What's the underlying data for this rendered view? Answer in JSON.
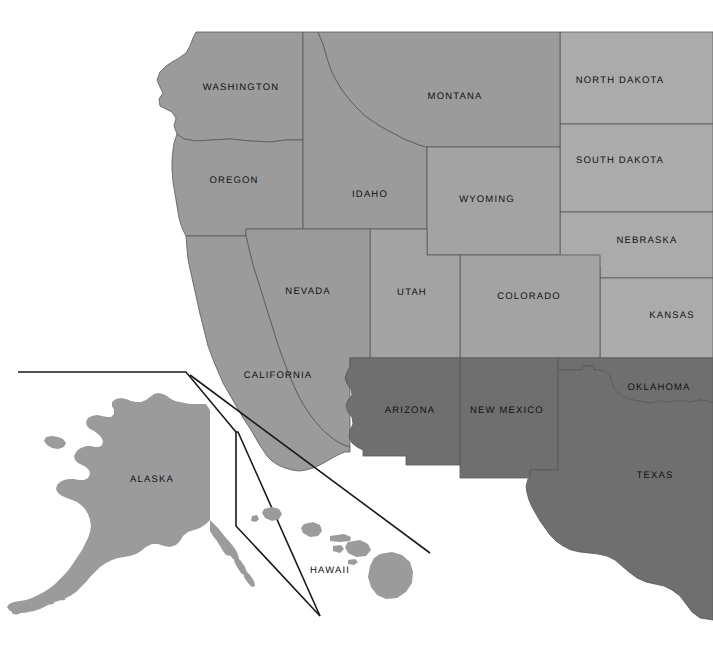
{
  "map": {
    "title": "Western United States state map",
    "background_color": "#ffffff",
    "border_color": "#595959",
    "inset_divider_color": "#1a1a1a",
    "region_colors": {
      "pacific_northwest": "#9b9b9b",
      "mountain_north": "#9b9b9b",
      "great_plains": "#ababab",
      "mountain_south": "#a3a3a3",
      "southwest": "#6f6f6f",
      "alaska": "#9b9b9b",
      "hawaii": "#9b9b9b"
    },
    "states": [
      {
        "name": "WASHINGTON",
        "label_x": 241,
        "label_y": 88,
        "fill": "#9b9b9b",
        "anchor": "center"
      },
      {
        "name": "OREGON",
        "label_x": 234,
        "label_y": 181,
        "fill": "#9b9b9b",
        "anchor": "center"
      },
      {
        "name": "IDAHO",
        "label_x": 370,
        "label_y": 195,
        "fill": "#9b9b9b",
        "anchor": "center"
      },
      {
        "name": "MONTANA",
        "label_x": 455,
        "label_y": 97,
        "fill": "#9b9b9b",
        "anchor": "center"
      },
      {
        "name": "NORTH DAKOTA",
        "label_x": 620,
        "label_y": 81,
        "fill": "#ababab",
        "anchor": "center"
      },
      {
        "name": "SOUTH DAKOTA",
        "label_x": 620,
        "label_y": 161,
        "fill": "#ababab",
        "anchor": "center"
      },
      {
        "name": "NEBRASKA",
        "label_x": 647,
        "label_y": 241,
        "fill": "#ababab",
        "anchor": "center"
      },
      {
        "name": "KANSAS",
        "label_x": 672,
        "label_y": 316,
        "fill": "#ababab",
        "anchor": "center"
      },
      {
        "name": "WYOMING",
        "label_x": 487,
        "label_y": 200,
        "fill": "#a3a3a3",
        "anchor": "center"
      },
      {
        "name": "COLORADO",
        "label_x": 529,
        "label_y": 297,
        "fill": "#a3a3a3",
        "anchor": "center"
      },
      {
        "name": "UTAH",
        "label_x": 412,
        "label_y": 293,
        "fill": "#a3a3a3",
        "anchor": "center"
      },
      {
        "name": "NEVADA",
        "label_x": 308,
        "label_y": 292,
        "fill": "#9b9b9b",
        "anchor": "center"
      },
      {
        "name": "CALIFORNIA",
        "label_x": 278,
        "label_y": 376,
        "fill": "#9b9b9b",
        "anchor": "center"
      },
      {
        "name": "ARIZONA",
        "label_x": 410,
        "label_y": 411,
        "fill": "#6f6f6f",
        "anchor": "center"
      },
      {
        "name": "NEW MEXICO",
        "label_x": 507,
        "label_y": 411,
        "fill": "#6f6f6f",
        "anchor": "center"
      },
      {
        "name": "OKLAHOMA",
        "label_x": 659,
        "label_y": 388,
        "fill": "#6f6f6f",
        "anchor": "center"
      },
      {
        "name": "TEXAS",
        "label_x": 655,
        "label_y": 476,
        "fill": "#6f6f6f",
        "anchor": "center"
      },
      {
        "name": "ALASKA",
        "label_x": 152,
        "label_y": 480,
        "fill": "#9b9b9b",
        "anchor": "center"
      },
      {
        "name": "HAWAII",
        "label_x": 330,
        "label_y": 571,
        "fill": "#9b9b9b",
        "anchor": "center"
      }
    ]
  }
}
